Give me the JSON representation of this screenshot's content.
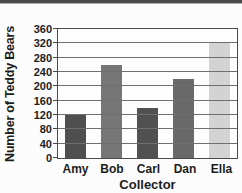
{
  "chart_data": {
    "type": "bar",
    "title": "",
    "categories": [
      "Amy",
      "Bob",
      "Carl",
      "Dan",
      "Ella"
    ],
    "values": [
      120,
      260,
      140,
      220,
      320
    ],
    "bar_colors": [
      "#4f4f4f",
      "#767676",
      "#515151",
      "#696969",
      "#d3d3d3"
    ],
    "xlabel": "Collector",
    "ylabel": "Number of Teddy Bears",
    "yticks": [
      0,
      40,
      80,
      120,
      160,
      200,
      240,
      280,
      320,
      360
    ],
    "ylim": [
      0,
      360
    ],
    "grid": "horizontal",
    "legend": "none"
  },
  "frame": {
    "top_strip_color": "#4a4a4a",
    "background": "#fcfcfc",
    "axis_color": "#4a4a4a",
    "gridline_color": "#6f6f6f",
    "text_color": "#1c1c1c"
  }
}
